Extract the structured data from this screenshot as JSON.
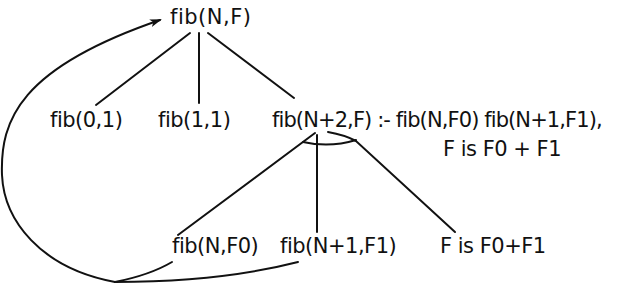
{
  "diagram": {
    "type": "and-or-tree",
    "colors": {
      "ink": "#111111",
      "background": "#ffffff"
    },
    "nodes": {
      "root": "fib(N,F)",
      "base0": "fib(0,1)",
      "base1": "fib(1,1)",
      "rule_line1": "fib(N+2,F) :- fib(N,F0) fib(N+1,F1),",
      "rule_line2": "F is F0 + F1",
      "goal1": "fib(N,F0)",
      "goal2": "fib(N+1,F1)",
      "goal3": "F is F0+F1"
    },
    "edges": [
      {
        "from": "root",
        "to": "base0"
      },
      {
        "from": "root",
        "to": "base1"
      },
      {
        "from": "root",
        "to": "rule"
      },
      {
        "from": "rule",
        "to": "goal1",
        "and_group": true
      },
      {
        "from": "rule",
        "to": "goal2",
        "and_group": true
      },
      {
        "from": "rule",
        "to": "goal3",
        "and_group": true
      },
      {
        "from": "goal1",
        "to": "root",
        "kind": "recursive-loop-arrow"
      },
      {
        "from": "goal2",
        "to": "root",
        "kind": "recursive-loop-arrow"
      }
    ]
  }
}
